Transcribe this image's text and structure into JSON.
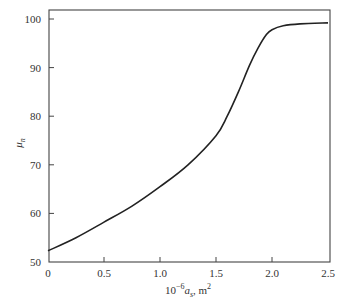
{
  "chart_data": {
    "type": "line",
    "title": "",
    "xlabel": "10^-6 a_s, m^2",
    "ylabel": "μ_n",
    "xlim": [
      0,
      2.5
    ],
    "ylim": [
      50,
      100
    ],
    "grid": false,
    "legend": null,
    "x_ticks": [
      "0",
      "0.5",
      "1.0",
      "1.5",
      "2.0",
      "2.5"
    ],
    "y_ticks": [
      "50",
      "60",
      "70",
      "80",
      "90",
      "100"
    ],
    "series": [
      {
        "name": "μ_n",
        "x": [
          0,
          0.25,
          0.5,
          0.75,
          1.0,
          1.25,
          1.5,
          1.6,
          1.7,
          1.8,
          1.875,
          1.95,
          2.0,
          2.1,
          2.25,
          2.5
        ],
        "values": [
          52.3,
          55.0,
          58.2,
          61.5,
          65.5,
          70.0,
          76.0,
          80.0,
          85.0,
          90.5,
          94.0,
          96.8,
          97.8,
          98.6,
          99.0,
          99.2
        ]
      }
    ]
  },
  "labels": {
    "y_axis": "μ",
    "y_axis_sub": "n",
    "x_axis_prefix": "10",
    "x_axis_exp": "−6",
    "x_axis_var": "a",
    "x_axis_sub": "s",
    "x_axis_unit": ", m",
    "x_axis_unit_exp": "2"
  },
  "colors": {
    "line": "#222222",
    "axis": "#444444"
  }
}
